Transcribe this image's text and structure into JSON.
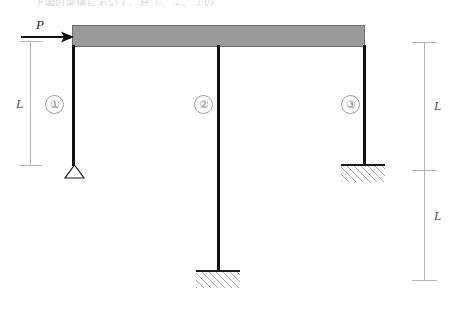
{
  "figure": {
    "header_text": "下図の架構において、柱①、②、③の",
    "background_color": "#ffffff"
  },
  "beam": {
    "name": "rigid-beam",
    "fill_color": "#9a9a9a",
    "border_color": "#6f6f6f"
  },
  "load": {
    "label": "P",
    "direction": "right",
    "color": "#1e1e1e"
  },
  "members": [
    {
      "label": "①",
      "support": "pin"
    },
    {
      "label": "②",
      "support": "fixed"
    },
    {
      "label": "③",
      "support": "fixed"
    }
  ],
  "dimensions": {
    "left": {
      "label": "L"
    },
    "right_upper": {
      "label": "L"
    },
    "right_lower": {
      "label": "L"
    }
  },
  "colors": {
    "beam": "#9a9a9a",
    "column": "#111111",
    "dimension": "#b4b4bc",
    "hatch": "#a9a9b2"
  }
}
